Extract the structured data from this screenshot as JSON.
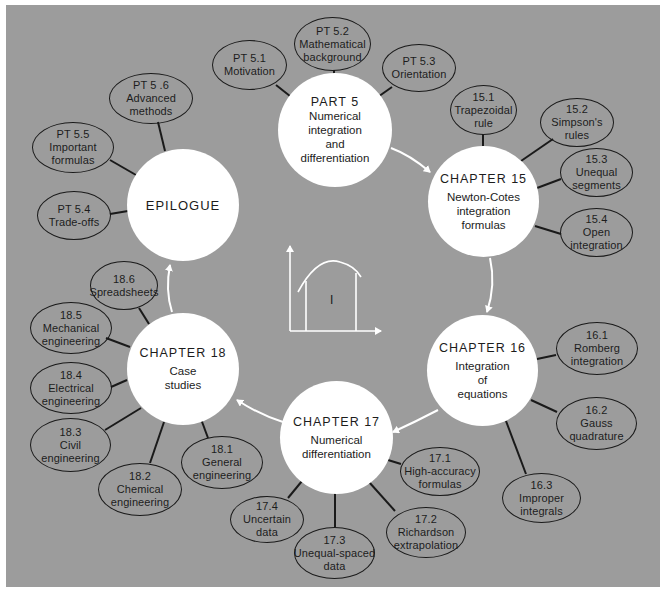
{
  "diagram": {
    "colors": {
      "background": "#9c9c9c",
      "circle_fill": "#ffffff",
      "outline": "#1a1a1a",
      "arrow": "#ffffff"
    },
    "hubs": {
      "part5": {
        "title": "PART 5",
        "subtitle": [
          "Numerical",
          "integration",
          "and",
          "differentiation"
        ]
      },
      "ch15": {
        "title": "CHAPTER 15",
        "subtitle": [
          "Newton-Cotes",
          "integration",
          "formulas"
        ]
      },
      "ch16": {
        "title": "CHAPTER 16",
        "subtitle": [
          "Integration",
          "of",
          "equations"
        ]
      },
      "ch17": {
        "title": "CHAPTER 17",
        "subtitle": [
          "Numerical",
          "differentiation"
        ]
      },
      "ch18": {
        "title": "CHAPTER 18",
        "subtitle": [
          "Case",
          "studies"
        ]
      },
      "epilogue": {
        "title": "EPILOGUE"
      }
    },
    "sections": {
      "pt51": {
        "num": "PT 5.1",
        "lines": [
          "Motivation"
        ]
      },
      "pt52": {
        "num": "PT 5.2",
        "lines": [
          "Mathematical",
          "background"
        ]
      },
      "pt53": {
        "num": "PT 5.3",
        "lines": [
          "Orientation"
        ]
      },
      "pt54": {
        "num": "PT 5.4",
        "lines": [
          "Trade-offs"
        ]
      },
      "pt55": {
        "num": "PT 5.5",
        "lines": [
          "Important",
          "formulas"
        ]
      },
      "pt56": {
        "num": "PT 5 .6",
        "lines": [
          "Advanced",
          "methods"
        ]
      },
      "s151": {
        "num": "15.1",
        "lines": [
          "Trapezoidal",
          "rule"
        ]
      },
      "s152": {
        "num": "15.2",
        "lines": [
          "Simpson's",
          "rules"
        ]
      },
      "s153": {
        "num": "15.3",
        "lines": [
          "Unequal",
          "segments"
        ]
      },
      "s154": {
        "num": "15.4",
        "lines": [
          "Open",
          "integration"
        ]
      },
      "s161": {
        "num": "16.1",
        "lines": [
          "Romberg",
          "integration"
        ]
      },
      "s162": {
        "num": "16.2",
        "lines": [
          "Gauss",
          "quadrature"
        ]
      },
      "s163": {
        "num": "16.3",
        "lines": [
          "Improper",
          "integrals"
        ]
      },
      "s171": {
        "num": "17.1",
        "lines": [
          "High-accuracy",
          "formulas"
        ]
      },
      "s172": {
        "num": "17.2",
        "lines": [
          "Richardson",
          "extrapolation"
        ]
      },
      "s173": {
        "num": "17.3",
        "lines": [
          "Unequal-spaced",
          "data"
        ]
      },
      "s174": {
        "num": "17.4",
        "lines": [
          "Uncertain",
          "data"
        ]
      },
      "s181": {
        "num": "18.1",
        "lines": [
          "General",
          "engineering"
        ]
      },
      "s182": {
        "num": "18.2",
        "lines": [
          "Chemical",
          "engineering"
        ]
      },
      "s183": {
        "num": "18.3",
        "lines": [
          "Civil",
          "engineering"
        ]
      },
      "s184": {
        "num": "18.4",
        "lines": [
          "Electrical",
          "engineering"
        ]
      },
      "s185": {
        "num": "18.5",
        "lines": [
          "Mechanical",
          "engineering"
        ]
      },
      "s186": {
        "num": "18.6",
        "lines": [
          "Spreadsheets"
        ]
      }
    },
    "center_graph": {
      "label": "I",
      "icon": "integral-area-under-curve-icon"
    }
  }
}
